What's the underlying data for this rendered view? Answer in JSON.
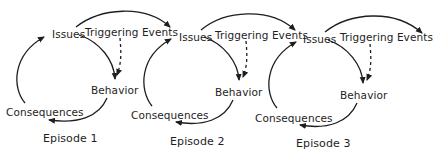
{
  "diagram": {
    "type": "cyclical process diagram",
    "colors": {
      "stroke": "#1e1e1e",
      "background": "#ffffff"
    },
    "episodes": [
      {
        "label": "Episode 1",
        "nodes": {
          "issues": "Issues",
          "triggering_events": "Triggering Events",
          "behavior": "Behavior",
          "consequences": "Consequences"
        }
      },
      {
        "label": "Episode 2",
        "nodes": {
          "issues": "Issues",
          "triggering_events": "Triggering Events",
          "behavior": "Behavior",
          "consequences": "Consequences"
        }
      },
      {
        "label": "Episode 3",
        "nodes": {
          "issues": "Issues",
          "triggering_events": "Triggering Events",
          "behavior": "Behavior",
          "consequences": "Consequences"
        }
      }
    ],
    "edges": [
      {
        "from": "Issues",
        "to": "Behavior",
        "style": "solid"
      },
      {
        "from": "Triggering Events",
        "to": "Behavior",
        "style": "dashed"
      },
      {
        "from": "Behavior",
        "to": "Consequences",
        "style": "solid"
      },
      {
        "from": "Consequences",
        "to": "Issues",
        "style": "solid"
      },
      {
        "from": "Issues (episode n)",
        "to": "Issues (episode n+1)",
        "style": "solid"
      }
    ]
  }
}
